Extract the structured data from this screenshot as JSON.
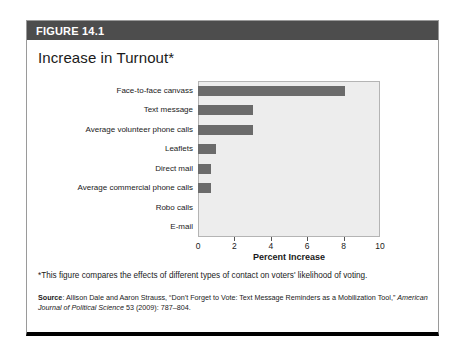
{
  "figure": {
    "header_label": "FIGURE 14.1",
    "title": "Increase in Turnout*",
    "footnote": "*This figure compares the effects of different types of contact on voters' likelihood of voting.",
    "source_label": "Source",
    "source_separator": ": ",
    "source_text_1": "Allison Dale and Aaron Strauss, “Don’t Forget to Vote: Text Message Reminders as a Mobilization Tool,” ",
    "source_journal": "American Journal of Political Science",
    "source_text_2": " 53 (2009): 787–804."
  },
  "colors": {
    "header_bg": "#4d4d4d",
    "header_text": "#ffffff",
    "bar": "#6b6b6b",
    "plot_bg": "#ededed",
    "plot_border": "#b4b4b4",
    "frame_border": "#9a9a9a",
    "frame_bottom": "#000000",
    "text": "#1a1a1a"
  },
  "chart_data": {
    "type": "bar",
    "orientation": "horizontal",
    "title": "Increase in Turnout*",
    "xlabel": "Percent Increase",
    "ylabel": "",
    "xlim": [
      0,
      10
    ],
    "xticks": [
      0,
      2,
      4,
      6,
      8,
      10
    ],
    "xtick_labels": [
      "0",
      "2",
      "4",
      "6",
      "8",
      "10"
    ],
    "grid": false,
    "legend": false,
    "categories": [
      "Face-to-face canvass",
      "Text message",
      "Average volunteer phone calls",
      "Leaflets",
      "Direct mail",
      "Average commercial phone calls",
      "Robo calls",
      "E-mail"
    ],
    "values": [
      8.1,
      3.0,
      3.0,
      1.0,
      0.7,
      0.7,
      0.0,
      0.0
    ]
  }
}
